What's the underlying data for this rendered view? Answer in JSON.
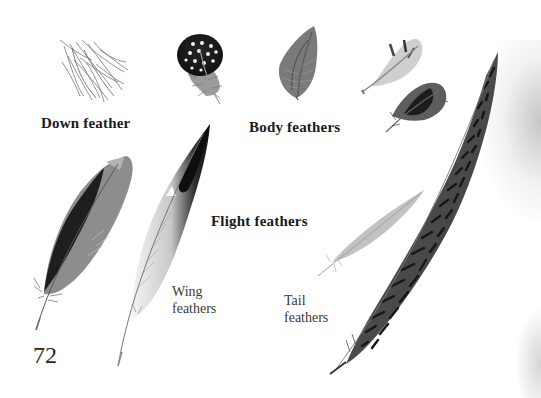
{
  "page": {
    "number": "72",
    "palette": {
      "background": "#ffffff",
      "text": "#1c1c1c",
      "feather_dark": "#1e1e1e",
      "feather_mid": "#7a7a7a",
      "feather_light": "#bdbdbd"
    }
  },
  "headings": {
    "down": "Down feather",
    "body": "Body feathers",
    "flight": "Flight feathers"
  },
  "sublabels": {
    "wing_line1": "Wing",
    "wing_line2": "feathers",
    "tail_line1": "Tail",
    "tail_line2": "feathers"
  },
  "illustrations": [
    {
      "id": "down-feather",
      "kind": "down",
      "label_ref": "headings.down"
    },
    {
      "id": "guinea-fowl-body-feather",
      "kind": "body",
      "pattern": "black with white spots"
    },
    {
      "id": "body-feather-gray",
      "kind": "body"
    },
    {
      "id": "body-feather-pale",
      "kind": "body"
    },
    {
      "id": "body-feather-dark",
      "kind": "body"
    },
    {
      "id": "wing-feather-gray",
      "kind": "wing"
    },
    {
      "id": "wing-feather-black-white",
      "kind": "wing"
    },
    {
      "id": "tail-feather-pale",
      "kind": "tail"
    },
    {
      "id": "tail-feather-pheasant-barred",
      "kind": "tail",
      "pattern": "barred"
    }
  ]
}
